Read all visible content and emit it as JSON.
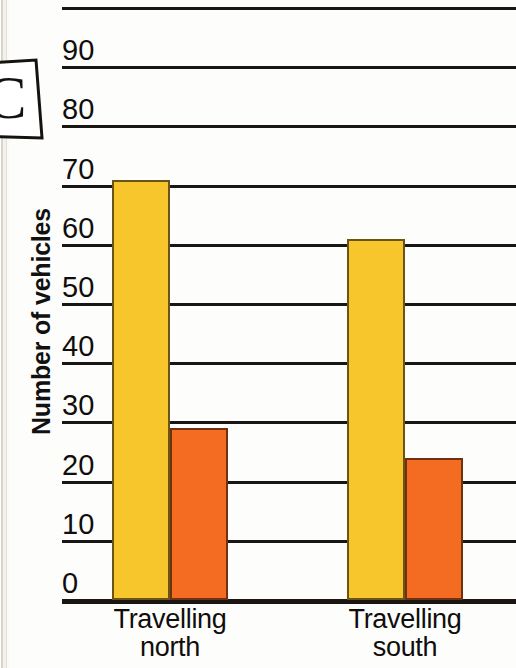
{
  "question_label": "C",
  "chart_data": {
    "type": "bar",
    "title": "",
    "xlabel": "",
    "ylabel": "Number of vehicles",
    "ylim": [
      0,
      100
    ],
    "ytick_step": 10,
    "ytick_labels": [
      "0",
      "10",
      "20",
      "30",
      "40",
      "50",
      "60",
      "70",
      "80",
      "90"
    ],
    "grid": true,
    "legend": "none",
    "categories": [
      "Travelling north",
      "Travelling south"
    ],
    "category_lines": [
      [
        "Travelling",
        "north"
      ],
      [
        "Travelling",
        "south"
      ]
    ],
    "series": [
      {
        "name": "yellow",
        "color": "#f6c62c",
        "values": [
          71,
          61
        ]
      },
      {
        "name": "orange",
        "color": "#f36c21",
        "values": [
          29,
          24
        ]
      }
    ],
    "colors": {
      "yellow": "#f6c62c",
      "orange": "#f36c21",
      "axis": "#1a1614"
    }
  }
}
